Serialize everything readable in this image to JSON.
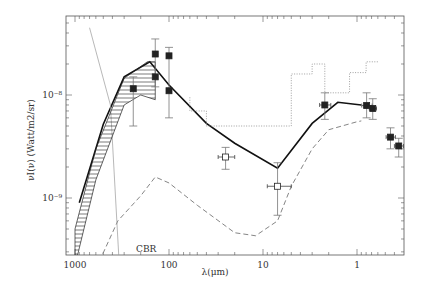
{
  "chart_data": {
    "type": "line",
    "title": "",
    "xlabel": "λ(μm)",
    "ylabel": "νI(ν) (Watt/m2/sr)",
    "x_scale": "log",
    "y_scale": "log",
    "x_reversed": true,
    "xlim": [
      1100,
      0.33
    ],
    "ylim": [
      1.5e-10,
      4.5e-08
    ],
    "x_ticks": [
      {
        "value": 1000,
        "label": "1000"
      },
      {
        "value": 100,
        "label": "100"
      },
      {
        "value": 10,
        "label": "10"
      },
      {
        "value": 1,
        "label": "1"
      }
    ],
    "y_ticks": [
      {
        "value": 1e-08,
        "label": "10⁻⁸"
      },
      {
        "value": 1e-09,
        "label": "10⁻⁹"
      }
    ],
    "grid": false,
    "annotations": [
      {
        "text": "CBR",
        "x": 230,
        "y": 1.8e-10
      }
    ],
    "series": [
      {
        "name": "model total (solid)",
        "style": "solid",
        "x": [
          900,
          500,
          300,
          160,
          100,
          40,
          20,
          7,
          3,
          1.6,
          0.9
        ],
        "y": [
          9e-10,
          5.2e-09,
          1.5e-08,
          2.1e-08,
          1.25e-08,
          5.3e-09,
          3.4e-09,
          1.95e-09,
          5.3e-09,
          8.5e-09,
          8e-09
        ]
      },
      {
        "name": "model (dashed)",
        "style": "dashed",
        "x": [
          700,
          350,
          200,
          140,
          100,
          50,
          20,
          12,
          7,
          5,
          3,
          2,
          1,
          0.9
        ],
        "y": [
          1.5e-10,
          6e-10,
          1.05e-09,
          1.6e-09,
          1.4e-09,
          8.5e-10,
          4.6e-10,
          4.3e-10,
          6e-10,
          1.3e-09,
          3e-09,
          4.6e-09,
          5.5e-09,
          5.6e-09
        ]
      },
      {
        "name": "CBR",
        "style": "thin",
        "x": [
          700,
          420,
          330
        ],
        "y": [
          4.5e-08,
          8e-09,
          1.5e-10
        ]
      },
      {
        "name": "FIRAS band (hatched)",
        "style": "hatched",
        "x_upper": [
          1000,
          600,
          300,
          170,
          140
        ],
        "y_upper": [
          5e-10,
          3e-09,
          1.45e-08,
          2.1e-08,
          2.1e-08
        ],
        "x_lower": [
          1000,
          600,
          300,
          200,
          140
        ],
        "y_lower": [
          2.2e-10,
          1.5e-09,
          8e-09,
          1e-08,
          9e-09
        ]
      },
      {
        "name": "upper limits (dotted)",
        "style": "dotted",
        "x": [
          60,
          60,
          40,
          40,
          5,
          5,
          3,
          3,
          2.2,
          2.2,
          1.2,
          1.2,
          0.8,
          0.8,
          0.6
        ],
        "y": [
          9.5e-09,
          7e-09,
          7e-09,
          5e-09,
          5e-09,
          1.6e-08,
          1.6e-08,
          2e-08,
          2e-08,
          1.05e-08,
          1.05e-08,
          1.65e-08,
          1.65e-08,
          2.1e-08,
          2.1e-08
        ]
      },
      {
        "name": "data points",
        "style": "markers",
        "points": [
          {
            "x": 240,
            "y": 1.15e-08,
            "yerr_lo": 5e-09,
            "yerr_hi": 1.5e-08,
            "marker": "filled"
          },
          {
            "x": 140,
            "y": 2.5e-08,
            "yerr_lo": 1.2e-08,
            "yerr_hi": 3.5e-08,
            "marker": "filled"
          },
          {
            "x": 140,
            "y": 1.5e-08,
            "marker": "filled"
          },
          {
            "x": 100,
            "y": 2.4e-08,
            "yerr_lo": 6e-09,
            "yerr_hi": 2.9e-08,
            "marker": "filled"
          },
          {
            "x": 100,
            "y": 1.1e-08,
            "marker": "filled"
          },
          {
            "x": 25,
            "y": 2.5e-09,
            "xerr": 5,
            "yerr_lo": 1.9e-09,
            "yerr_hi": 3.1e-09,
            "marker": "open"
          },
          {
            "x": 7,
            "y": 1.3e-09,
            "xerr": 2,
            "yerr_lo": 6.8e-10,
            "yerr_hi": 2.2e-09,
            "marker": "open"
          },
          {
            "x": 2.2,
            "y": 8e-09,
            "xerr": 0.3,
            "yerr_lo": 5.8e-09,
            "yerr_hi": 1.05e-08,
            "marker": "filled"
          },
          {
            "x": 0.79,
            "y": 7.9e-09,
            "xerr": 0.1,
            "yerr_lo": 6e-09,
            "yerr_hi": 1.05e-08,
            "marker": "filled"
          },
          {
            "x": 0.68,
            "y": 7.4e-09,
            "xerr": 0.06,
            "yerr_lo": 5.8e-09,
            "yerr_hi": 9.2e-09,
            "marker": "filled"
          },
          {
            "x": 0.44,
            "y": 3.9e-09,
            "xerr": 0.05,
            "yerr_lo": 3e-09,
            "yerr_hi": 4.8e-09,
            "marker": "filled"
          },
          {
            "x": 0.36,
            "y": 3.2e-09,
            "xerr": 0.04,
            "yerr_lo": 2.5e-09,
            "yerr_hi": 3.8e-09,
            "marker": "filled"
          }
        ]
      }
    ]
  }
}
